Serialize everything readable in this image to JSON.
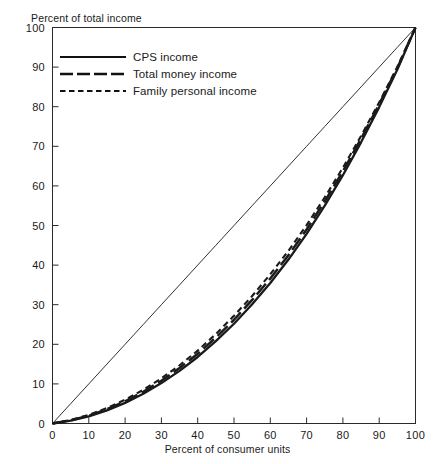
{
  "chart_data": {
    "type": "line",
    "title": "",
    "xlabel": "Percent of consumer units",
    "ylabel": "Percent of total income",
    "xlim": [
      0,
      100
    ],
    "ylim": [
      0,
      100
    ],
    "grid": false,
    "legend_position": "upper-left-inside",
    "xticks": [
      0,
      10,
      20,
      30,
      40,
      50,
      60,
      70,
      80,
      90,
      100
    ],
    "yticks": [
      0,
      10,
      20,
      30,
      40,
      50,
      60,
      70,
      80,
      90,
      100
    ],
    "xtick_labels": [
      "0",
      "10",
      "20",
      "30",
      "40",
      "50",
      "60",
      "70",
      "80",
      "90",
      "100"
    ],
    "ytick_labels": [
      "0",
      "10",
      "20",
      "30",
      "40",
      "50",
      "60",
      "70",
      "80",
      "90",
      "100"
    ],
    "x": [
      0,
      5,
      10,
      15,
      20,
      25,
      30,
      35,
      40,
      45,
      50,
      55,
      60,
      65,
      70,
      75,
      80,
      85,
      90,
      95,
      100
    ],
    "series": [
      {
        "name": "CPS income",
        "style": "solid",
        "values": [
          0,
          0.7,
          1.8,
          3.3,
          5.2,
          7.5,
          10.2,
          13.3,
          16.8,
          20.8,
          25.2,
          30.1,
          35.5,
          41.4,
          47.9,
          55.0,
          62.7,
          71.0,
          79.9,
          89.4,
          100
        ]
      },
      {
        "name": "Total money income",
        "style": "long-dash",
        "values": [
          0,
          0.8,
          2.0,
          3.6,
          5.6,
          8.0,
          10.8,
          14.0,
          17.6,
          21.7,
          26.2,
          31.2,
          36.6,
          42.5,
          49.0,
          56.1,
          63.7,
          71.9,
          80.6,
          89.8,
          100
        ]
      },
      {
        "name": "Family personal income",
        "style": "short-dash",
        "values": [
          0,
          0.9,
          2.2,
          3.9,
          6.0,
          8.5,
          11.4,
          14.7,
          18.4,
          22.6,
          27.2,
          32.2,
          37.7,
          43.6,
          50.1,
          57.1,
          64.6,
          72.6,
          81.1,
          90.1,
          100
        ]
      },
      {
        "name": "line of equality",
        "style": "thin-solid",
        "values": [
          0,
          5,
          10,
          15,
          20,
          25,
          30,
          35,
          40,
          45,
          50,
          55,
          60,
          65,
          70,
          75,
          80,
          85,
          90,
          95,
          100
        ]
      }
    ]
  },
  "legend": {
    "entries": [
      {
        "label": "CPS income"
      },
      {
        "label": "Total money income"
      },
      {
        "label": "Family personal income"
      }
    ]
  },
  "colors": {
    "ink": "#1a1a1a",
    "frame": "#2a2a2a",
    "background": "#ffffff"
  }
}
